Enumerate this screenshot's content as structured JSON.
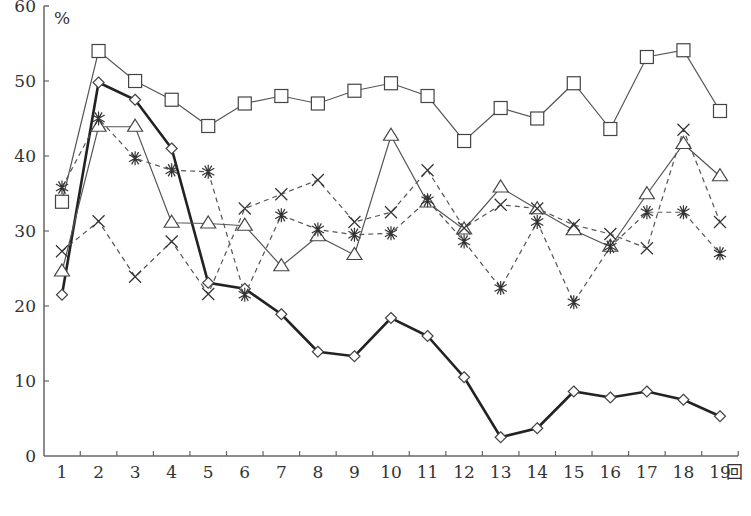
{
  "chart_data": {
    "type": "line",
    "title": "",
    "xlabel": "回",
    "ylabel": "%",
    "ylim": [
      0,
      60
    ],
    "yticks": [
      0,
      10,
      20,
      30,
      40,
      50,
      60
    ],
    "grid": false,
    "legend": null,
    "categories": [
      "1",
      "2",
      "3",
      "4",
      "5",
      "6",
      "7",
      "8",
      "9",
      "10",
      "11",
      "12",
      "13",
      "14",
      "15",
      "16",
      "17",
      "18",
      "19"
    ],
    "series": [
      {
        "name": "square",
        "marker": "square",
        "line": "solid-thin",
        "color": "#555555",
        "values": [
          33.9,
          54.0,
          50.0,
          47.5,
          44.0,
          47.0,
          48.0,
          47.0,
          48.7,
          49.7,
          48.0,
          42.0,
          46.4,
          45.0,
          49.7,
          43.6,
          53.2,
          54.1,
          46.0
        ]
      },
      {
        "name": "diamond",
        "marker": "diamond",
        "line": "solid-thick",
        "color": "#222222",
        "values": [
          21.5,
          49.8,
          47.5,
          41.0,
          23.1,
          22.3,
          18.9,
          13.9,
          13.3,
          18.4,
          16.0,
          10.5,
          2.5,
          3.7,
          8.6,
          7.8,
          8.6,
          7.5,
          5.3
        ]
      },
      {
        "name": "triangle",
        "marker": "triangle",
        "line": "solid-thin",
        "color": "#555555",
        "values": [
          24.6,
          43.9,
          43.9,
          31.1,
          31.0,
          30.7,
          25.3,
          29.3,
          26.8,
          42.7,
          33.8,
          30.2,
          35.8,
          32.9,
          30.1,
          27.9,
          34.9,
          41.6,
          37.3
        ]
      },
      {
        "name": "asterisk",
        "marker": "asterisk",
        "line": "dashed",
        "color": "#555555",
        "values": [
          35.8,
          45.0,
          39.7,
          38.1,
          37.9,
          21.5,
          32.1,
          30.2,
          29.5,
          29.7,
          34.1,
          28.6,
          22.4,
          31.2,
          20.5,
          27.9,
          32.5,
          32.5,
          27.0
        ]
      },
      {
        "name": "cross",
        "marker": "x",
        "line": "dashed",
        "color": "#555555",
        "values": [
          27.3,
          31.3,
          23.9,
          28.6,
          21.6,
          33.0,
          34.9,
          36.8,
          31.2,
          32.5,
          38.1,
          30.4,
          33.5,
          33.0,
          30.8,
          29.6,
          27.7,
          43.5,
          31.2
        ]
      }
    ]
  },
  "axis": {
    "y_unit": "%",
    "x_unit": "回"
  }
}
